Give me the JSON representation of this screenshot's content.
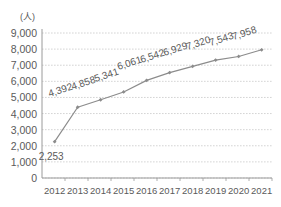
{
  "chart_data": {
    "type": "line",
    "title": "",
    "subtitle": "",
    "xlabel": "",
    "ylabel": "",
    "unit_label": "(人)",
    "categories": [
      "2012",
      "2013",
      "2014",
      "2015",
      "2016",
      "2017",
      "2018",
      "2019",
      "2020",
      "2021"
    ],
    "values": [
      2253,
      4392,
      4858,
      5341,
      6061,
      6542,
      6929,
      7320,
      7543,
      7958
    ],
    "data_labels": [
      "2,253",
      "4,392",
      "4,858",
      "5,341",
      "6,061",
      "6,542",
      "6,929",
      "7,320",
      "7,543",
      "7,958"
    ],
    "ylim": [
      0,
      9000
    ],
    "ytick_values": [
      0,
      1000,
      2000,
      3000,
      4000,
      5000,
      6000,
      7000,
      8000,
      9000
    ],
    "ytick_labels": [
      "0",
      "1,000",
      "2,000",
      "3,000",
      "4,000",
      "5,000",
      "6,000",
      "7,000",
      "8,000",
      "9,000"
    ],
    "grid": true,
    "grid_axis": "y",
    "legend": false,
    "legend_position": "none",
    "series": [
      {
        "name": "",
        "values": [
          2253,
          4392,
          4858,
          5341,
          6061,
          6542,
          6929,
          7320,
          7543,
          7958
        ]
      }
    ],
    "colors": {
      "line": "#8c8c8c",
      "marker": "#8c8c8c",
      "grid": "#c9c9c9",
      "axis": "#9a9a9a",
      "text": "#5a5a5a",
      "background": "#ffffff"
    },
    "label_rotation_deg": -18
  }
}
